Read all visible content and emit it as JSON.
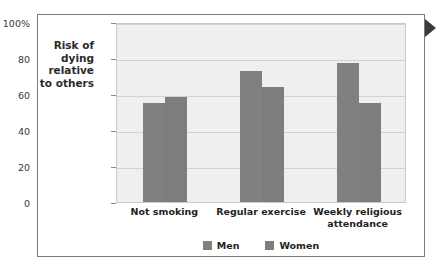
{
  "chart_data": {
    "type": "bar",
    "title": "",
    "xlabel": "",
    "ylabel": "Risk of dying relative to others",
    "ylabel_lines": [
      "Risk of",
      "dying",
      "relative",
      "to others"
    ],
    "categories": [
      "Not smoking",
      "Regular exercise",
      "Weekly religious attendance"
    ],
    "category_lines": [
      [
        "Not smoking"
      ],
      [
        "Regular exercise"
      ],
      [
        "Weekly religious",
        "attendance"
      ]
    ],
    "series": [
      {
        "name": "Men",
        "values": [
          55,
          73,
          77
        ],
        "color": "#808080"
      },
      {
        "name": "Women",
        "values": [
          58.5,
          64,
          55
        ],
        "color": "#7d7d7d"
      }
    ],
    "ylim": [
      0,
      100
    ],
    "yticks": [
      0,
      20,
      40,
      60,
      80,
      100
    ],
    "ytick_labels": [
      "0",
      "20",
      "40",
      "60",
      "80",
      "100%"
    ],
    "grid": true,
    "legend_position": "bottom-center"
  },
  "legend": {
    "items": [
      {
        "label": "Men"
      },
      {
        "label": "Women"
      }
    ]
  },
  "figure": {
    "plot_background": "#efefef",
    "gridline_color": "#d2d2d2",
    "frame_color": "#7b7b7b",
    "marker_icon": "triangle-right-icon"
  }
}
